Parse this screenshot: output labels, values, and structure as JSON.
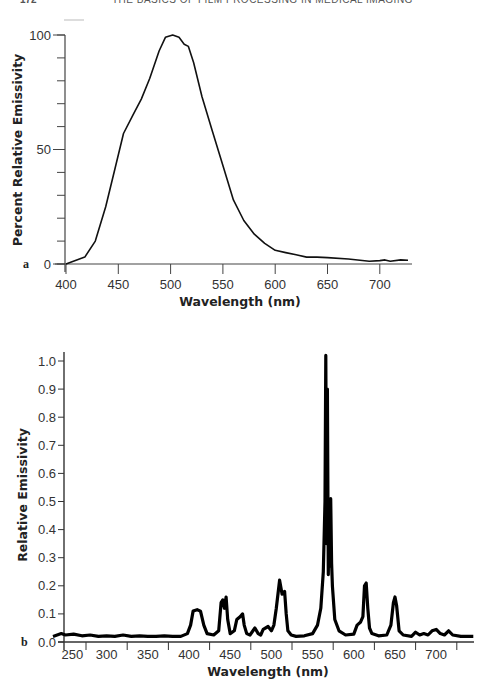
{
  "header": {
    "page_number": "172",
    "running_title": "THE BASICS OF FILM PROCESSING IN MEDICAL IMAGING"
  },
  "chart_data": [
    {
      "panel": "a",
      "type": "line",
      "title": "",
      "xlabel": "Wavelength (nm)",
      "ylabel": "Percent Relative Emissivity",
      "xlim": [
        400,
        730
      ],
      "ylim": [
        0,
        100
      ],
      "x_ticks": [
        400,
        450,
        500,
        550,
        600,
        650,
        700
      ],
      "y_tick_labels": [
        0,
        50,
        100
      ],
      "y_minor_step": 10,
      "grid": false,
      "legend": "none",
      "x": [
        400,
        418,
        428,
        438,
        447,
        455,
        464,
        472,
        480,
        489,
        495,
        502,
        508,
        513,
        517,
        522,
        530,
        540,
        550,
        560,
        570,
        580,
        590,
        600,
        610,
        620,
        630,
        640,
        650,
        670,
        690,
        700,
        705,
        710,
        720,
        727
      ],
      "values": [
        0,
        3,
        10,
        25,
        42,
        57,
        65,
        72,
        81,
        93,
        99,
        100,
        99,
        96,
        95,
        88,
        73,
        58,
        43,
        28,
        19,
        13,
        9,
        6,
        5,
        4,
        3,
        3,
        2.8,
        2.2,
        1.2,
        1.5,
        1.8,
        1.2,
        1.8,
        1.6
      ]
    },
    {
      "panel": "b",
      "type": "line",
      "title": "",
      "xlabel": "Wavelength (nm)",
      "ylabel": "Relative Emissivity",
      "xlim": [
        235,
        745
      ],
      "ylim": [
        0.0,
        1.05
      ],
      "x_tick_labels": [
        250,
        300,
        350,
        400,
        450,
        500,
        550,
        600,
        650,
        700
      ],
      "y_ticks": [
        0.0,
        0.1,
        0.2,
        0.3,
        0.4,
        0.5,
        0.6,
        0.7,
        0.8,
        0.9,
        1.0
      ],
      "grid": false,
      "legend": "none",
      "x": [
        235,
        245,
        250,
        260,
        270,
        280,
        290,
        300,
        310,
        320,
        330,
        340,
        350,
        360,
        370,
        380,
        390,
        398,
        402,
        405,
        410,
        414,
        418,
        422,
        430,
        436,
        439,
        441,
        443,
        445,
        447,
        450,
        455,
        458,
        462,
        465,
        467,
        470,
        474,
        480,
        484,
        487,
        490,
        496,
        500,
        503,
        506,
        510,
        513,
        516,
        518,
        520,
        524,
        530,
        540,
        550,
        556,
        560,
        563,
        565,
        566,
        567,
        568,
        569,
        570,
        571,
        572,
        573,
        574,
        577,
        582,
        590,
        600,
        604,
        608,
        611,
        613,
        615,
        617,
        619,
        622,
        630,
        640,
        645,
        648,
        650,
        652,
        655,
        660,
        670,
        675,
        680,
        685,
        690,
        695,
        700,
        705,
        710,
        715,
        720,
        730,
        745
      ],
      "values": [
        0.02,
        0.03,
        0.025,
        0.028,
        0.022,
        0.025,
        0.02,
        0.022,
        0.02,
        0.025,
        0.02,
        0.022,
        0.02,
        0.02,
        0.022,
        0.02,
        0.02,
        0.03,
        0.06,
        0.11,
        0.115,
        0.11,
        0.06,
        0.03,
        0.025,
        0.04,
        0.14,
        0.15,
        0.12,
        0.16,
        0.08,
        0.03,
        0.04,
        0.08,
        0.09,
        0.1,
        0.06,
        0.03,
        0.025,
        0.05,
        0.03,
        0.025,
        0.045,
        0.055,
        0.04,
        0.06,
        0.12,
        0.22,
        0.17,
        0.18,
        0.1,
        0.04,
        0.025,
        0.02,
        0.022,
        0.03,
        0.06,
        0.12,
        0.25,
        0.5,
        1.02,
        0.35,
        0.9,
        0.24,
        0.5,
        0.27,
        0.51,
        0.28,
        0.2,
        0.08,
        0.04,
        0.025,
        0.028,
        0.06,
        0.07,
        0.09,
        0.2,
        0.21,
        0.12,
        0.05,
        0.03,
        0.022,
        0.025,
        0.06,
        0.14,
        0.16,
        0.13,
        0.04,
        0.025,
        0.02,
        0.035,
        0.025,
        0.03,
        0.025,
        0.04,
        0.045,
        0.03,
        0.025,
        0.04,
        0.025,
        0.02,
        0.02
      ]
    }
  ]
}
